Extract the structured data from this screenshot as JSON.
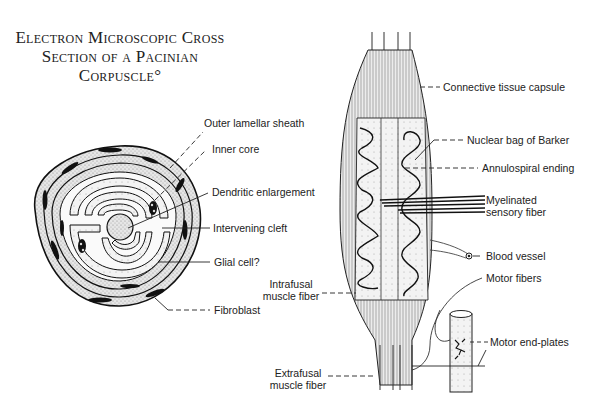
{
  "title": {
    "line1": "Electron Microscopic Cross",
    "line2": "Section of a Pacinian",
    "line3": "Corpuscle°"
  },
  "pacinian_labels": {
    "outer_lamellar_sheath": "Outer lamellar sheath",
    "inner_core": "Inner core",
    "dendritic_enlargement": "Dendritic enlargement",
    "intervening_cleft": "Intervening cleft",
    "glial_cell": "Glial cell?",
    "fibroblast": "Fibroblast"
  },
  "spindle_labels": {
    "connective_tissue_capsule": "Connective tissue capsule",
    "nuclear_bag_of_barker": "Nuclear bag of Barker",
    "annulospiral_ending": "Annulospiral ending",
    "myelinated_sensory_fiber_line1": "Myelinated",
    "myelinated_sensory_fiber_line2": "sensory fiber",
    "blood_vessel": "Blood vessel",
    "motor_fibers": "Motor fibers",
    "motor_end_plates": "Motor end-plates",
    "intrafusal_line1": "Intrafusal",
    "intrafusal_line2": "muscle fiber",
    "extrafusal_line1": "Extrafusal",
    "extrafusal_line2": "muscle fiber"
  },
  "colors": {
    "ink": "#1a1a1a",
    "stipple": "#bdbdbd",
    "core_fill": "#d8d8d8",
    "background": "#ffffff"
  }
}
